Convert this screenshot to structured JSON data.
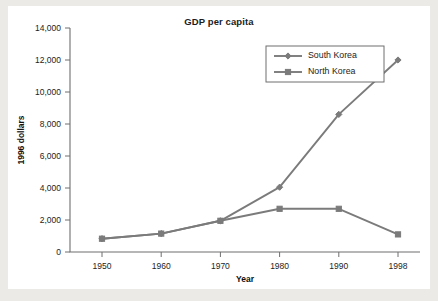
{
  "chart_data": {
    "type": "line",
    "title": "GDP per capita",
    "xlabel": "Year",
    "ylabel": "1996 dollars",
    "categories": [
      "1950",
      "1960",
      "1970",
      "1980",
      "1990",
      "1998"
    ],
    "ylim": [
      0,
      14000
    ],
    "ytick_labels": [
      "0",
      "2,000",
      "4,000",
      "6,000",
      "8,000",
      "10,000",
      "12,000",
      "14,000"
    ],
    "ytick_values": [
      0,
      2000,
      4000,
      6000,
      8000,
      10000,
      12000,
      14000
    ],
    "grid": false,
    "legend_position": "upper-right-inside",
    "series": [
      {
        "name": "South Korea",
        "marker": "diamond",
        "color": "#7b7b7b",
        "values": [
          830,
          1150,
          1950,
          4050,
          8600,
          12000
        ]
      },
      {
        "name": "North Korea",
        "marker": "square",
        "color": "#7b7b7b",
        "values": [
          830,
          1150,
          1950,
          2700,
          2700,
          1100
        ]
      }
    ]
  },
  "legend": {
    "entries": [
      {
        "label": "South Korea"
      },
      {
        "label": "North Korea"
      }
    ]
  },
  "colors": {
    "page_background": "#eceae6",
    "card_background": "#ffffff",
    "line": "#7b7b7b",
    "axis": "#6f6f6f",
    "text": "#1d1d1d"
  }
}
